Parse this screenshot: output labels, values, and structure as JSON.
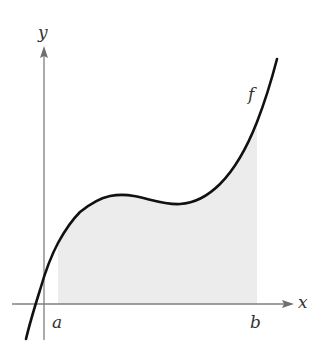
{
  "figure": {
    "type": "area-under-curve diagram",
    "axes": {
      "x_label": "x",
      "y_label": "y"
    },
    "function_label": "f",
    "interval": {
      "start_label": "a",
      "end_label": "b"
    },
    "colors": {
      "curve": "#111111",
      "axes": "#7f7f7f",
      "shaded_region": "#ececec",
      "background": "#ffffff",
      "labels": "#333333"
    }
  }
}
